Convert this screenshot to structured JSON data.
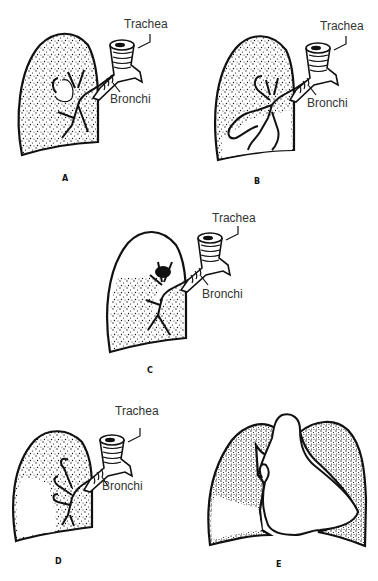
{
  "figure": {
    "panels": [
      {
        "id": "A",
        "letter": "A",
        "trachea_label": "Trachea",
        "bronchi_label": "Bronchi"
      },
      {
        "id": "B",
        "letter": "B",
        "trachea_label": "Trachea",
        "bronchi_label": "Bronchi"
      },
      {
        "id": "C",
        "letter": "C",
        "trachea_label": "Trachea",
        "bronchi_label": "Bronchi"
      },
      {
        "id": "D",
        "letter": "D",
        "trachea_label": "Trachea",
        "bronchi_label": "Bronchi"
      },
      {
        "id": "E",
        "letter": "E"
      }
    ],
    "colors": {
      "ink": "#111111",
      "label_text": "#333333",
      "background": "#ffffff"
    }
  }
}
